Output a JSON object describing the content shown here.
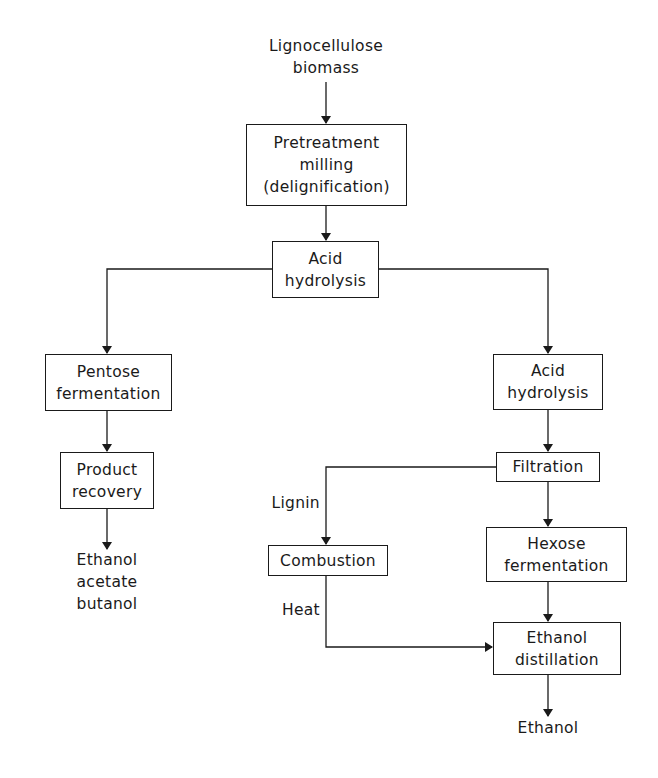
{
  "diagram": {
    "type": "process-flowchart",
    "input": {
      "line1": "Lignocellulose",
      "line2": "biomass"
    },
    "nodes": {
      "pretreatment": {
        "line1": "Pretreatment",
        "line2": "milling",
        "line3": "(delignification)"
      },
      "acid_hydrolysis_1": {
        "line1": "Acid",
        "line2": "hydrolysis"
      },
      "pentose_fermentation": {
        "line1": "Pentose",
        "line2": "fermentation"
      },
      "product_recovery": {
        "line1": "Product",
        "line2": "recovery"
      },
      "acid_hydrolysis_2": {
        "line1": "Acid",
        "line2": "hydrolysis"
      },
      "filtration": {
        "line1": "Filtration"
      },
      "combustion": {
        "line1": "Combustion"
      },
      "hexose_fermentation": {
        "line1": "Hexose",
        "line2": "fermentation"
      },
      "ethanol_distillation": {
        "line1": "Ethanol",
        "line2": "distillation"
      }
    },
    "outputs": {
      "left": {
        "line1": "Ethanol",
        "line2": "acetate",
        "line3": "butanol"
      },
      "right": {
        "line1": "Ethanol"
      }
    },
    "edge_labels": {
      "lignin": "Lignin",
      "heat": "Heat"
    },
    "edges": [
      [
        "input",
        "pretreatment"
      ],
      [
        "pretreatment",
        "acid_hydrolysis_1"
      ],
      [
        "acid_hydrolysis_1",
        "pentose_fermentation"
      ],
      [
        "acid_hydrolysis_1",
        "acid_hydrolysis_2"
      ],
      [
        "pentose_fermentation",
        "product_recovery"
      ],
      [
        "product_recovery",
        "outputs.left"
      ],
      [
        "acid_hydrolysis_2",
        "filtration"
      ],
      [
        "filtration",
        "combustion",
        "Lignin"
      ],
      [
        "filtration",
        "hexose_fermentation"
      ],
      [
        "combustion",
        "ethanol_distillation",
        "Heat"
      ],
      [
        "hexose_fermentation",
        "ethanol_distillation"
      ],
      [
        "ethanol_distillation",
        "outputs.right"
      ]
    ],
    "colors": {
      "line": "#1a1a1a",
      "background": "#ffffff"
    }
  }
}
